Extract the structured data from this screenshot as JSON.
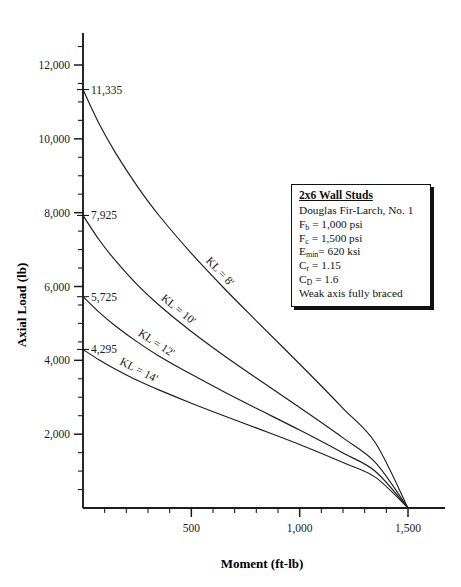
{
  "chart_data": {
    "type": "line",
    "title": "",
    "xlabel": "Moment (ft-lb)",
    "ylabel": "Axial Load (lb)",
    "xlim": [
      0,
      1550
    ],
    "ylim": [
      0,
      13000
    ],
    "xticks": [
      500,
      1000,
      1500
    ],
    "xtick_labels": [
      "500",
      "1,000",
      "1,500"
    ],
    "xtick_minor_step": 100,
    "yticks": [
      2000,
      4000,
      6000,
      8000,
      10000,
      12000
    ],
    "ytick_labels": [
      "2,000",
      "4,000",
      "6,000",
      "8,000",
      "10,000",
      "12,000"
    ],
    "ytick_minor_step": 500,
    "grid": false,
    "legend_position": "none",
    "convergence_point": {
      "x": 1500,
      "y": 0
    },
    "series": [
      {
        "name": "KL = 8'",
        "label": "KL = 8'",
        "intercept_label": "11,335",
        "points": [
          {
            "x": 0,
            "y": 11335
          },
          {
            "x": 75,
            "y": 10400
          },
          {
            "x": 150,
            "y": 9620
          },
          {
            "x": 250,
            "y": 8720
          },
          {
            "x": 350,
            "y": 7930
          },
          {
            "x": 500,
            "y": 6900
          },
          {
            "x": 650,
            "y": 5960
          },
          {
            "x": 800,
            "y": 5070
          },
          {
            "x": 1000,
            "y": 3900
          },
          {
            "x": 1200,
            "y": 2700
          },
          {
            "x": 1350,
            "y": 1760
          },
          {
            "x": 1500,
            "y": 0
          }
        ]
      },
      {
        "name": "KL = 10'",
        "label": "KL = 10'",
        "intercept_label": "7,925",
        "points": [
          {
            "x": 0,
            "y": 7925
          },
          {
            "x": 75,
            "y": 7260
          },
          {
            "x": 150,
            "y": 6700
          },
          {
            "x": 250,
            "y": 6050
          },
          {
            "x": 350,
            "y": 5500
          },
          {
            "x": 500,
            "y": 4780
          },
          {
            "x": 650,
            "y": 4130
          },
          {
            "x": 800,
            "y": 3520
          },
          {
            "x": 1000,
            "y": 2720
          },
          {
            "x": 1200,
            "y": 1900
          },
          {
            "x": 1350,
            "y": 1230
          },
          {
            "x": 1500,
            "y": 0
          }
        ]
      },
      {
        "name": "KL = 12'",
        "label": "KL = 12'",
        "intercept_label": "5,725",
        "points": [
          {
            "x": 0,
            "y": 5725
          },
          {
            "x": 75,
            "y": 5300
          },
          {
            "x": 150,
            "y": 4930
          },
          {
            "x": 250,
            "y": 4500
          },
          {
            "x": 350,
            "y": 4120
          },
          {
            "x": 500,
            "y": 3620
          },
          {
            "x": 650,
            "y": 3150
          },
          {
            "x": 800,
            "y": 2700
          },
          {
            "x": 1000,
            "y": 2110
          },
          {
            "x": 1200,
            "y": 1490
          },
          {
            "x": 1350,
            "y": 990
          },
          {
            "x": 1500,
            "y": 0
          }
        ]
      },
      {
        "name": "KL = 14'",
        "label": "KL = 14'",
        "intercept_label": "4,295",
        "points": [
          {
            "x": 0,
            "y": 4295
          },
          {
            "x": 75,
            "y": 4010
          },
          {
            "x": 150,
            "y": 3760
          },
          {
            "x": 250,
            "y": 3460
          },
          {
            "x": 350,
            "y": 3200
          },
          {
            "x": 500,
            "y": 2840
          },
          {
            "x": 650,
            "y": 2500
          },
          {
            "x": 800,
            "y": 2170
          },
          {
            "x": 1000,
            "y": 1720
          },
          {
            "x": 1200,
            "y": 1230
          },
          {
            "x": 1350,
            "y": 830
          },
          {
            "x": 1500,
            "y": 0
          }
        ]
      }
    ]
  },
  "legend_note": {
    "title": "2x6 Wall Studs",
    "lines": [
      "Douglas Fir-Larch, No. 1",
      "F₀ = 1,000 psi",
      "F₀ = 1,500 psi",
      "E₀= 620 ksi",
      "C₀ = 1.15",
      "C₀ = 1.6",
      "Weak axis fully braced"
    ],
    "species": "Douglas Fir-Larch, No. 1",
    "fb": {
      "symbol": "F",
      "sub": "b",
      "value": "= 1,000 psi"
    },
    "fc": {
      "symbol": "F",
      "sub": "c",
      "value": "= 1,500 psi"
    },
    "emin": {
      "symbol": "E",
      "sub": "min",
      "value": "= 620 ksi"
    },
    "cr": {
      "symbol": "C",
      "sub": "r",
      "value": "= 1.15"
    },
    "cd": {
      "symbol": "C",
      "sub": "D",
      "value": "= 1.6"
    },
    "bracing": "Weak axis fully braced"
  }
}
